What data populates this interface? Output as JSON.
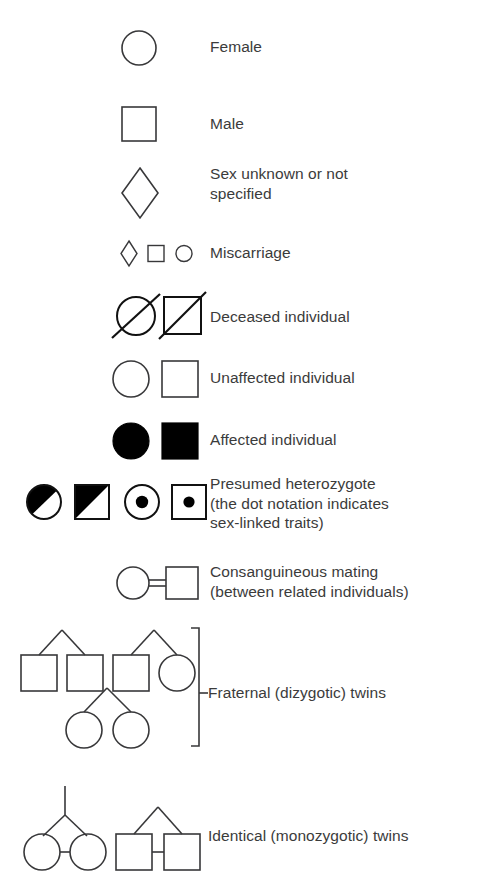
{
  "figure": {
    "kind": "pedigree-symbol-legend",
    "background_color": "#ffffff",
    "text_color": "#3b3b3b",
    "line_color": "#38383a"
  },
  "rows": [
    {
      "id": "female",
      "label": "Female",
      "symbols": [
        "circle-outline"
      ]
    },
    {
      "id": "male",
      "label": "Male",
      "symbols": [
        "square-outline"
      ]
    },
    {
      "id": "sex-unknown",
      "label": "Sex unknown or not\nspecified",
      "symbols": [
        "diamond-outline"
      ]
    },
    {
      "id": "miscarriage",
      "label": "Miscarriage",
      "symbols": [
        "small-diamond-outline",
        "small-square-outline",
        "small-circle-outline"
      ]
    },
    {
      "id": "deceased",
      "label": "Deceased individual",
      "symbols": [
        "circle-slashed",
        "square-slashed"
      ]
    },
    {
      "id": "unaffected",
      "label": "Unaffected individual",
      "symbols": [
        "circle-outline",
        "square-outline"
      ]
    },
    {
      "id": "affected",
      "label": "Affected individual",
      "symbols": [
        "circle-filled",
        "square-filled"
      ]
    },
    {
      "id": "presumed-heterozygote",
      "label": "Presumed heterozygote\n(the dot notation indicates\nsex-linked traits)",
      "symbols": [
        "circle-half-filled",
        "square-half-filled",
        "circle-dot",
        "square-dot"
      ]
    },
    {
      "id": "consanguineous-mating",
      "label": "Consanguineous mating\n(between related individuals)",
      "symbols": [
        "circle-double-line-square"
      ]
    },
    {
      "id": "fraternal-twins",
      "label": "Fraternal (dizygotic) twins",
      "symbols": [
        "pedigree-dizygotic-group"
      ],
      "has_bracket": true
    },
    {
      "id": "identical-twins",
      "label": "Identical (monozygotic) twins",
      "symbols": [
        "pedigree-monozygotic-circles",
        "pedigree-monozygotic-squares"
      ]
    }
  ]
}
